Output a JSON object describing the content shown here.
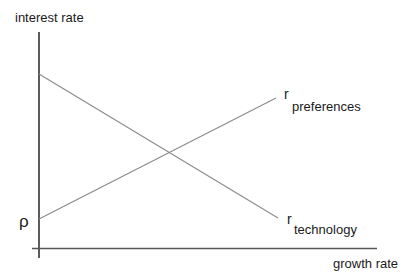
{
  "diagram": {
    "y_axis_label": "interest rate",
    "x_axis_label": "growth rate",
    "rho_label": "ρ",
    "lines": [
      {
        "name": "technology",
        "symbol": "r",
        "subscript": "technology",
        "slope": "downward"
      },
      {
        "name": "preferences",
        "symbol": "r",
        "subscript": "preferences",
        "slope": "upward",
        "intercept_label": "ρ"
      }
    ],
    "colors": {
      "axis": "#333333",
      "line": "#8a8a8a",
      "text": "#1a1a1a"
    }
  }
}
